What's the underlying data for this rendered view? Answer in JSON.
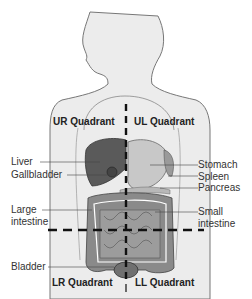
{
  "diagram": {
    "quadrants": {
      "ur": "UR Quadrant",
      "ul": "UL Quadrant",
      "lr": "LR Quadrant",
      "ll": "LL Quadrant"
    },
    "labels_left": {
      "liver": "Liver",
      "gallbladder": "Gallbladder",
      "large_intestine_1": "Large",
      "large_intestine_2": "intestine",
      "bladder": "Bladder"
    },
    "labels_right": {
      "stomach": "Stomach",
      "spleen": "Spleen",
      "pancreas": "Pancreas",
      "small_intestine_1": "Small",
      "small_intestine_2": "intestine"
    },
    "colors": {
      "body_fill": "#ececec",
      "outline": "#666666",
      "liver": "#5a5a5a",
      "stomach": "#c8c8c8",
      "intestine": "#8a8a8a",
      "divider": "#111111"
    }
  }
}
